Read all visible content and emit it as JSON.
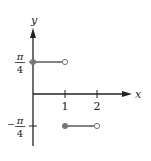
{
  "chart_data": {
    "type": "line",
    "title": "",
    "xlabel": "x",
    "ylabel": "y",
    "xlim": [
      0,
      3
    ],
    "ylim": [
      -1.2,
      1.1
    ],
    "x_ticks": [
      {
        "value": 1,
        "label": "1"
      },
      {
        "value": 2,
        "label": "2"
      }
    ],
    "y_ticks": [
      {
        "value": 1,
        "label_num": "π",
        "label_den": "4",
        "sign": ""
      },
      {
        "value": -1,
        "label_num": "π",
        "label_den": "4",
        "sign": "−"
      }
    ],
    "y_unit_note": "y values in units of π/4",
    "series": [
      {
        "name": "segment-1",
        "x": [
          0,
          1
        ],
        "y": [
          1,
          1
        ],
        "start": "closed",
        "end": "open"
      },
      {
        "name": "segment-2",
        "x": [
          1,
          2
        ],
        "y": [
          -1,
          -1
        ],
        "start": "closed",
        "end": "open"
      }
    ],
    "colors": {
      "axis": "#222222",
      "segment": "#777777"
    },
    "grid": false,
    "legend": "none"
  }
}
